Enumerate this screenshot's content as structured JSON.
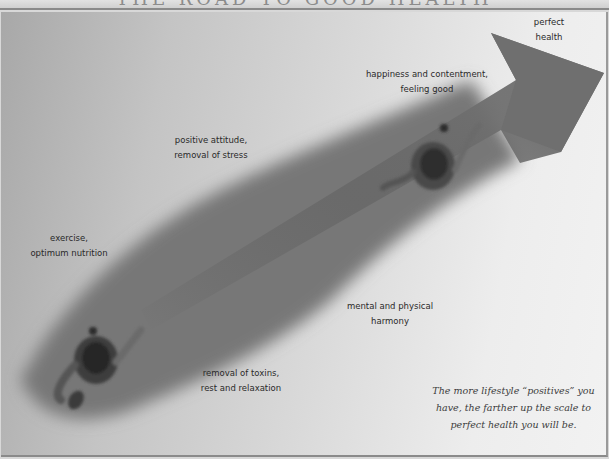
{
  "title": "THE ROAD TO GOOD HEALTH",
  "arrow": {
    "color": "#6f6f6f",
    "target_label": [
      "perfect",
      "health"
    ]
  },
  "stages": [
    {
      "id": "exercise",
      "lines": [
        "exercise,",
        "optimum nutrition"
      ]
    },
    {
      "id": "positive-attitude",
      "lines": [
        "positive attitude,",
        "removal of stress"
      ]
    },
    {
      "id": "happiness",
      "lines": [
        "happiness and contentment,",
        "feeling good"
      ]
    },
    {
      "id": "toxins",
      "lines": [
        "removal of toxins,",
        "rest and relaxation"
      ]
    },
    {
      "id": "harmony",
      "lines": [
        "mental and  physical",
        "harmony"
      ]
    }
  ],
  "caption": {
    "lines": [
      "The more lifestyle “positives” you",
      "have, the farther up the scale to",
      "perfect health you will be."
    ]
  },
  "figures": [
    "walker-start",
    "walker-middle"
  ]
}
